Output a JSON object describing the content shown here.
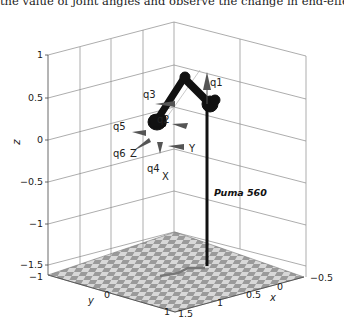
{
  "caption": "the value of joint angles and observe the change in end-effector position",
  "figure": {
    "robot_name": "Puma 560",
    "axes": {
      "z_label": "z",
      "y_label": "y",
      "x_label": "x",
      "z_ticks": [
        "1",
        "0.5",
        "0",
        "−0.5",
        "−1",
        "−1.5"
      ],
      "y_ticks": [
        "−1",
        "0",
        "1"
      ],
      "x_ticks": [
        "1.5",
        "1",
        "0.5",
        "0",
        "−0.5"
      ]
    },
    "joint_labels": [
      "q1",
      "q2",
      "q3",
      "q4",
      "q5",
      "q6"
    ],
    "frame_labels": [
      "X",
      "Y",
      "Z"
    ]
  }
}
